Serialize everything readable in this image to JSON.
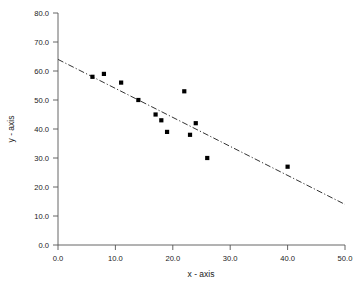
{
  "chart_data": {
    "type": "scatter",
    "title": "",
    "xlabel": "x - axis",
    "ylabel": "y - axis",
    "xlim": [
      0,
      50
    ],
    "ylim": [
      0,
      80
    ],
    "xticks": [
      "0.0",
      "10.0",
      "20.0",
      "30.0",
      "40.0",
      "50.0"
    ],
    "xtick_values": [
      0,
      10,
      20,
      30,
      40,
      50
    ],
    "yticks": [
      "0.0",
      "10.0",
      "20.0",
      "30.0",
      "40.0",
      "50.0",
      "60.0",
      "70.0",
      "80.0"
    ],
    "ytick_values": [
      0,
      10,
      20,
      30,
      40,
      50,
      60,
      70,
      80
    ],
    "grid": false,
    "legend": null,
    "marker": "square",
    "marker_color": "#000000",
    "points": [
      {
        "x": 6.0,
        "y": 58.0
      },
      {
        "x": 8.0,
        "y": 59.0
      },
      {
        "x": 11.0,
        "y": 56.0
      },
      {
        "x": 14.0,
        "y": 50.0
      },
      {
        "x": 17.0,
        "y": 45.0
      },
      {
        "x": 18.0,
        "y": 43.0
      },
      {
        "x": 19.0,
        "y": 39.0
      },
      {
        "x": 22.0,
        "y": 53.0
      },
      {
        "x": 23.0,
        "y": 38.0
      },
      {
        "x": 24.0,
        "y": 42.0
      },
      {
        "x": 26.0,
        "y": 30.0
      },
      {
        "x": 40.0,
        "y": 27.0
      }
    ],
    "trendline": {
      "style": "dash-dot",
      "color": "#333333",
      "x_start": 0.0,
      "y_start": 64.0,
      "x_end": 50.0,
      "y_end": 14.0
    }
  }
}
